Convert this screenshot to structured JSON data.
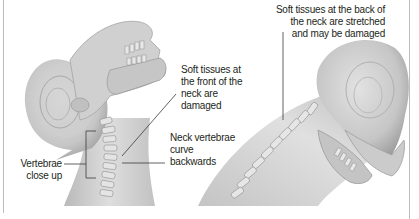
{
  "labels": {
    "back_tissue": [
      "Soft tissues at the back of",
      "the neck are stretched",
      "and may be damaged"
    ],
    "front_tissue": [
      "Soft tissues at",
      "the front of the",
      "neck are",
      "damaged"
    ],
    "vertebrae_curve": [
      "Neck vertebrae",
      "curve",
      "backwards"
    ],
    "vertebrae_closeup": [
      "Vertebrae",
      "close up"
    ]
  },
  "figures": {
    "left": "head tilted backwards (hyperextension) with exposed skull and cervical spine",
    "right": "head thrown forward (hyperflexion) with exposed skull and cervical spine"
  },
  "colors": {
    "text": "#231f20",
    "leader_line": "#3a3a3a",
    "frame": "#bdbdbd",
    "skin_light": "#e6e6e6",
    "skin_mid": "#c8c8c8",
    "skin_dark": "#9a9a9a"
  }
}
